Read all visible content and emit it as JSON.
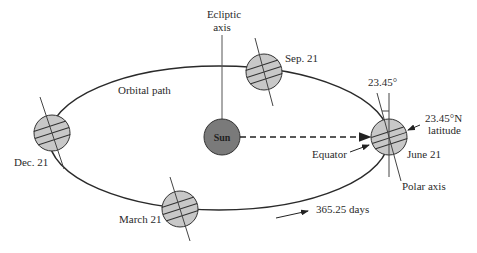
{
  "diagram": {
    "labels": {
      "ecliptic_axis_line1": "Ecliptic",
      "ecliptic_axis_line2": "axis",
      "orbital_path": "Orbital path",
      "sun": "Sun",
      "sep21": "Sep. 21",
      "dec21": "Dec. 21",
      "march21": "March 21",
      "june21": "June 21",
      "tilt_angle": "23.45°",
      "latitude_line1": "23.45°N",
      "latitude_line2": "latitude",
      "equator": "Equator",
      "polar_axis": "Polar axis",
      "period": "365.25 days"
    },
    "colors": {
      "planet_fill": "#c8c8c8",
      "sun_fill": "#7a7a7a",
      "stroke": "#2a2a2a"
    }
  }
}
